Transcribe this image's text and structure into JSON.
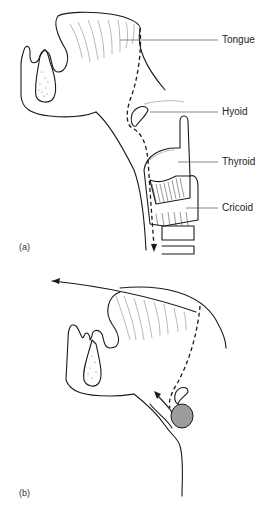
{
  "figure": {
    "panels": [
      {
        "id": "a",
        "label": "(a)",
        "structures": [
          {
            "name": "Tongue",
            "label": "Tongue"
          },
          {
            "name": "Hyoid",
            "label": "Hyoid"
          },
          {
            "name": "Thyroid",
            "label": "Thyroid"
          },
          {
            "name": "Cricoid",
            "label": "Cricoid"
          }
        ]
      },
      {
        "id": "b",
        "label": "(b)"
      }
    ]
  }
}
